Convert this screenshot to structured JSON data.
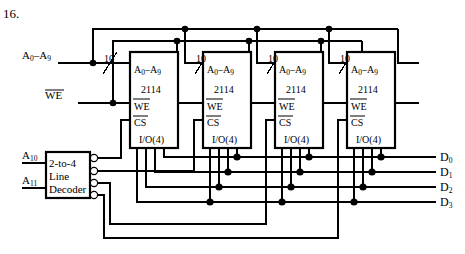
{
  "figure": {
    "question_number": "16.",
    "title_note": "",
    "inputs": {
      "address_bus_label": "A",
      "address_bus_sub": "0",
      "address_bus_label2": "–A",
      "address_bus_sub2": "9",
      "address_bus_full": "A0–A9",
      "bus_width_label": "10",
      "write_enable_label": "WE",
      "decoder_input_high_label": "A",
      "decoder_input_high_sub": "10",
      "decoder_input_low_label": "A",
      "decoder_input_low_sub": "11",
      "decoder_input_high_full": "A10",
      "decoder_input_low_full": "A11"
    },
    "decoder": {
      "name": "2-to-4 Line Decoder",
      "line1": "2-to-4",
      "line2": "Line",
      "line3": "Decoder",
      "output_count": 4,
      "outputs_active_low": true
    },
    "chips": [
      {
        "index": 0,
        "addr_label": "A0–A9",
        "addr_label_main": "A",
        "addr_label_sub": "0",
        "addr_label_main2": "–A",
        "addr_label_sub2": "9",
        "part_number": "2114",
        "we_pin": "WE",
        "cs_pin": "CS",
        "io_pin": "I/O(4)",
        "bus_width": "10"
      },
      {
        "index": 1,
        "addr_label": "A0–A9",
        "part_number": "2114",
        "we_pin": "WE",
        "cs_pin": "CS",
        "io_pin": "I/O(4)",
        "bus_width": "10"
      },
      {
        "index": 2,
        "addr_label": "A0–A9",
        "part_number": "2114",
        "we_pin": "WE",
        "cs_pin": "CS",
        "io_pin": "I/O(4)",
        "bus_width": "10"
      },
      {
        "index": 3,
        "addr_label": "A0–A9",
        "part_number": "2114",
        "we_pin": "WE",
        "cs_pin": "CS",
        "io_pin": "I/O(4)",
        "bus_width": "10"
      }
    ],
    "data_outputs": [
      {
        "label": "D",
        "sub": "0",
        "full": "D0"
      },
      {
        "label": "D",
        "sub": "1",
        "full": "D1"
      },
      {
        "label": "D",
        "sub": "2",
        "full": "D2"
      },
      {
        "label": "D",
        "sub": "3",
        "full": "D3"
      }
    ],
    "colors": {
      "line": "#000000",
      "background": "#ffffff",
      "text": "#000000"
    }
  }
}
